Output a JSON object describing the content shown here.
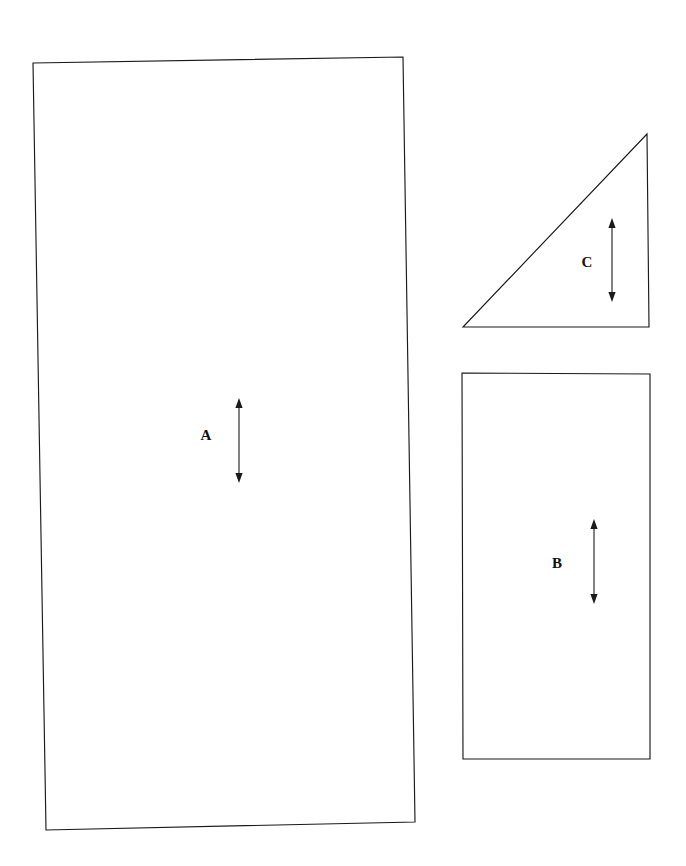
{
  "canvas": {
    "width": 686,
    "height": 866,
    "background_color": "#ffffff",
    "stroke_color": "#1a1a1a",
    "label_color": "#111111"
  },
  "shapes": [
    {
      "id": "shape-a",
      "label": "A",
      "kind": "quadrilateral",
      "points": "33,63 403,57 415,822 46,830",
      "label_x": 206,
      "label_y": 437,
      "arrow": {
        "x": 239,
        "y_top": 399,
        "y_bottom": 482,
        "style": "double-headed-vertical"
      }
    },
    {
      "id": "shape-c",
      "label": "C",
      "kind": "right-triangle",
      "points": "647,134 649,327 463,327",
      "label_x": 587,
      "label_y": 264,
      "arrow": {
        "x": 612,
        "y_top": 219,
        "y_bottom": 301,
        "style": "double-headed-vertical"
      }
    },
    {
      "id": "shape-b",
      "label": "B",
      "kind": "rectangle",
      "points": "462,373 650,374 650,759 463,759",
      "label_x": 557,
      "label_y": 565,
      "arrow": {
        "x": 594,
        "y_top": 520,
        "y_bottom": 603,
        "style": "double-headed-vertical"
      }
    }
  ]
}
